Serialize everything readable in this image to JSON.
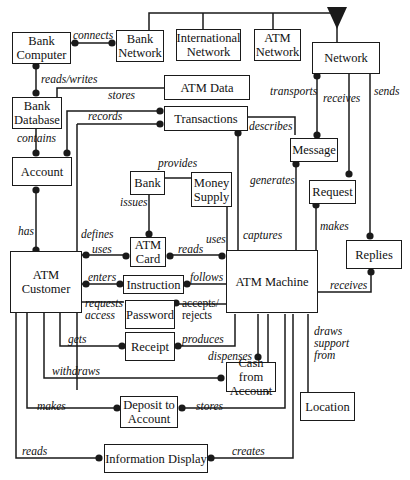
{
  "diagram": {
    "entities": {
      "bank_computer": "Bank\nComputer",
      "bank_network": "Bank\nNetwork",
      "international_network": "International\nNetwork",
      "atm_network": "ATM\nNetwork",
      "network": "Network",
      "bank_database": "Bank\nDatabase",
      "atm_data": "ATM Data",
      "transactions": "Transactions",
      "account": "Account",
      "message": "Message",
      "bank": "Bank",
      "money_supply": "Money\nSupply",
      "request": "Request",
      "atm_card": "ATM\nCard",
      "replies": "Replies",
      "atm_customer": "ATM\nCustomer",
      "instruction": "Instruction",
      "atm_machine": "ATM Machine",
      "password": "Password",
      "receipt": "Receipt",
      "cash_from_account": "Cash from\nAccount",
      "deposit_to_account": "Deposit to\nAccount",
      "location": "Location",
      "information_display": "Information Display"
    },
    "relationships": {
      "connects": "connects",
      "reads_writes": "reads/writes",
      "stores_atm_data": "stores",
      "records": "records",
      "contains": "contains",
      "transports": "transports",
      "receives_network": "receives",
      "sends": "sends",
      "describes": "describes",
      "provides": "provides",
      "generates": "generates",
      "issues": "issues",
      "makes_request": "makes",
      "has": "has",
      "defines": "defines",
      "uses_card": "uses",
      "reads_card": "reads",
      "uses_money": "uses",
      "captures": "captures",
      "enters": "enters",
      "follows": "follows",
      "requests_access": "requests\naccess",
      "accepts_rejects": "accepts/\nrejects",
      "receives_replies": "receives",
      "gets": "gets",
      "produces": "produces",
      "dispenses": "dispenses",
      "draws_support_from": "draws\nsupport\nfrom",
      "withdraws": "withdraws",
      "makes_deposit": "makes",
      "stores_deposit": "stores",
      "reads_display": "reads",
      "creates": "creates"
    },
    "colors": {
      "line": "#1a1a1a",
      "background": "#ffffff"
    }
  }
}
